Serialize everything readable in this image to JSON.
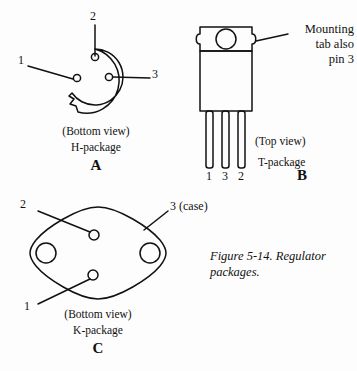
{
  "figure": {
    "caption": "Figure 5-14. Regulator",
    "caption_line2": "packages.",
    "background": "#fdfdfd",
    "ink": "#111111"
  },
  "packages": [
    {
      "key": "h",
      "letter": "A",
      "view": "(Bottom view)",
      "name": "H-package",
      "pins": [
        {
          "label": "1",
          "position": "left"
        },
        {
          "label": "2",
          "position": "top"
        },
        {
          "label": "3",
          "position": "right"
        }
      ]
    },
    {
      "key": "t",
      "letter": "B",
      "view": "(Top view)",
      "name": "T-package",
      "note_line1": "Mounting",
      "note_line2": "tab also",
      "note_line3": "pin 3",
      "leads": [
        "1",
        "3",
        "2"
      ]
    },
    {
      "key": "k",
      "letter": "C",
      "view": "(Bottom view)",
      "name": "K-package",
      "pins": [
        {
          "label": "1",
          "position": "lower-left"
        },
        {
          "label": "2",
          "position": "upper-left"
        },
        {
          "label": "3 (case)",
          "position": "upper-right"
        }
      ]
    }
  ]
}
